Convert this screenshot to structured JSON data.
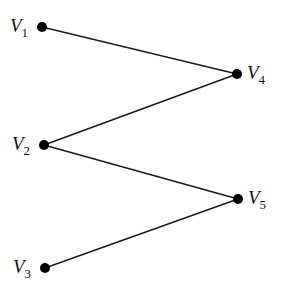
{
  "diagram": {
    "type": "bipartite-graph",
    "nodes": [
      {
        "id": "V1",
        "letter": "V",
        "sub": "1",
        "x": 42,
        "y": 27,
        "label_side": "left"
      },
      {
        "id": "V2",
        "letter": "V",
        "sub": "2",
        "x": 44,
        "y": 145,
        "label_side": "left"
      },
      {
        "id": "V3",
        "letter": "V",
        "sub": "3",
        "x": 45,
        "y": 268,
        "label_side": "left"
      },
      {
        "id": "V4",
        "letter": "V",
        "sub": "4",
        "x": 237,
        "y": 74,
        "label_side": "right"
      },
      {
        "id": "V5",
        "letter": "V",
        "sub": "5",
        "x": 238,
        "y": 199,
        "label_side": "right"
      }
    ],
    "edges": [
      {
        "from": "V1",
        "to": "V4"
      },
      {
        "from": "V2",
        "to": "V4"
      },
      {
        "from": "V2",
        "to": "V5"
      },
      {
        "from": "V3",
        "to": "V5"
      }
    ],
    "colors": {
      "node": "#000000",
      "edge": "#1a1a1a",
      "background": "#ffffff"
    }
  }
}
